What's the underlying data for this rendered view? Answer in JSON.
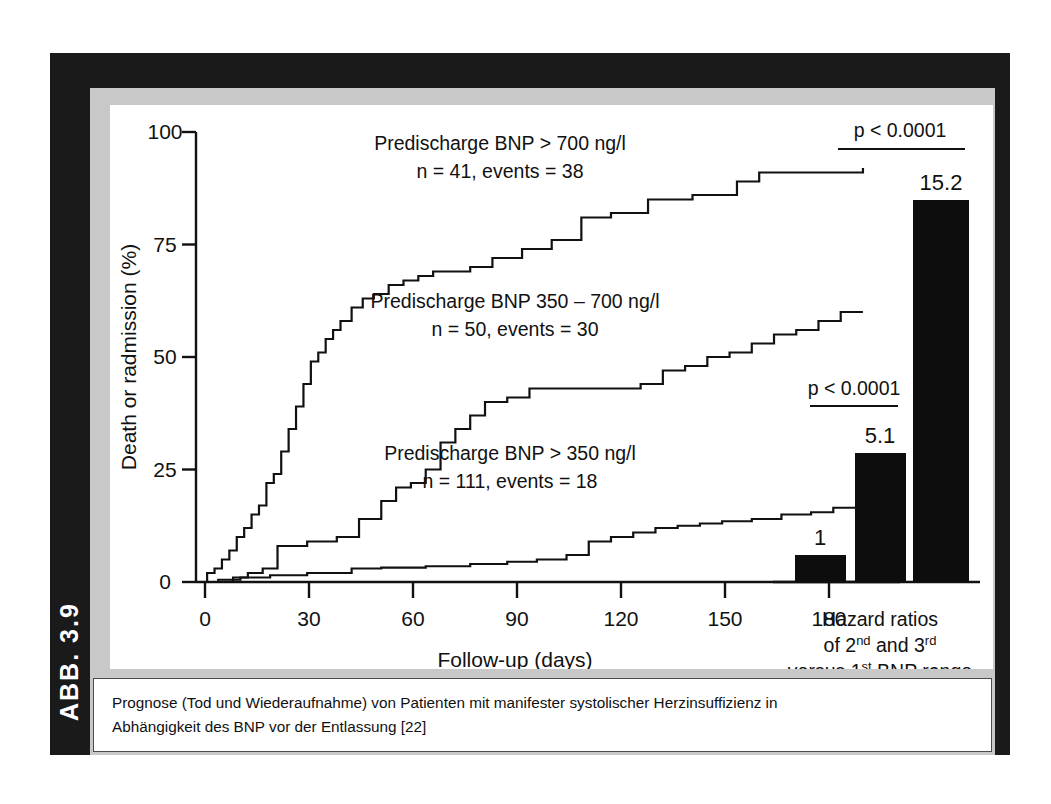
{
  "figure": {
    "number_label": "ABB. 3.9",
    "caption_line1": "Prognose (Tod und Wiederaufnahme) von Patienten mit manifester systolischer Herzinsuffizienz in",
    "caption_line2": "Abhängigkeit des BNP vor der Entlassung [22]",
    "frame_color": "#1a1a1a",
    "panel_color": "#c8c8c8",
    "canvas_color": "#ffffff",
    "ink_color": "#111111"
  },
  "chart_data": [
    {
      "type": "line",
      "title": "",
      "xlabel": "Follow-up (days)",
      "ylabel": "Death or radmission (%)",
      "xlim": [
        0,
        190
      ],
      "ylim": [
        0,
        100
      ],
      "xticks": [
        0,
        30,
        60,
        90,
        120,
        150,
        180
      ],
      "yticks": [
        0,
        25,
        50,
        75,
        100
      ],
      "grid": false,
      "legend_position": "inline-annotations",
      "series": [
        {
          "name": "Predischarge BNP > 700 ng/l",
          "label_line1": "Predischarge BNP > 700 ng/l",
          "label_line2": "n = 41, events = 38",
          "n": 41,
          "events": 38,
          "final_value": 92,
          "x": [
            0,
            3,
            5,
            7,
            9,
            11,
            13,
            15,
            17,
            19,
            21,
            23,
            25,
            27,
            29,
            31,
            33,
            35,
            37,
            39,
            42,
            45,
            48,
            52,
            56,
            60,
            64,
            68,
            74,
            80,
            88,
            96,
            104,
            112,
            122,
            134,
            146,
            152,
            180
          ],
          "y": [
            0,
            2,
            3,
            5,
            7,
            10,
            12,
            15,
            17,
            22,
            24,
            29,
            34,
            39,
            44,
            49,
            51,
            54,
            56,
            58,
            61,
            63,
            64,
            66,
            67,
            68,
            69,
            69,
            70,
            72,
            74,
            76,
            81,
            82,
            85,
            86,
            89,
            91,
            92
          ]
        },
        {
          "name": "Predischarge BNP 350 – 700 ng/l",
          "label_line1": "Predischarge BNP 350 – 700 ng/l",
          "label_line2": "n = 50, events = 30",
          "n": 50,
          "events": 30,
          "final_value": 60,
          "x": [
            0,
            10,
            14,
            18,
            22,
            30,
            38,
            44,
            50,
            54,
            58,
            62,
            66,
            70,
            74,
            78,
            84,
            90,
            100,
            112,
            120,
            126,
            132,
            138,
            144,
            150,
            156,
            162,
            168,
            174,
            180
          ],
          "y": [
            0,
            1,
            2,
            3,
            8,
            9,
            10,
            14,
            18,
            21,
            22,
            25,
            31,
            34,
            37,
            40,
            41,
            43,
            43,
            43,
            44,
            47,
            48,
            50,
            51,
            53,
            55,
            56,
            58,
            60,
            60
          ]
        },
        {
          "name": "Predischarge BNP > 350 ng/l",
          "label_line1": "Predischarge BNP > 350 ng/l",
          "label_line2": "n = 111, events = 18",
          "n": 111,
          "events": 18,
          "final_value": 16.5,
          "x": [
            0,
            6,
            12,
            20,
            30,
            42,
            50,
            62,
            74,
            84,
            92,
            100,
            106,
            112,
            118,
            124,
            130,
            136,
            142,
            150,
            158,
            166,
            172,
            180
          ],
          "y": [
            0,
            0.5,
            1,
            1.5,
            2,
            3,
            3.2,
            3.5,
            4,
            4.5,
            5,
            6,
            9,
            10,
            11,
            12,
            12.5,
            13,
            13.5,
            14,
            15,
            15.5,
            16.5,
            16.5
          ]
        }
      ]
    },
    {
      "type": "bar",
      "title": "",
      "xlabel": "",
      "ylabel": "",
      "categories": [
        "1st BNP range",
        "2nd BNP range",
        "3rd BNP range"
      ],
      "values": [
        1,
        5.1,
        15.2
      ],
      "value_labels": [
        "1",
        "5.1",
        "15.2"
      ],
      "ylim": [
        0,
        18
      ],
      "grid": false,
      "caption_line1": "Hazard ratios",
      "caption_line2_pre": "of 2",
      "caption_line2_sup1": "nd",
      "caption_line2_mid": " and 3",
      "caption_line2_sup2": "rd",
      "caption_line3_pre": "versus 1",
      "caption_line3_sup": "st",
      "caption_line3_post": "  BNP range",
      "annotations": [
        {
          "text": "p < 0.0001",
          "compares": [
            "1",
            "5.1"
          ]
        },
        {
          "text": "p < 0.0001",
          "compares": [
            "1",
            "15.2"
          ]
        }
      ]
    }
  ]
}
